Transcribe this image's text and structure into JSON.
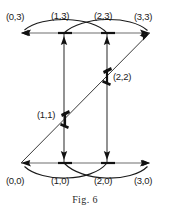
{
  "figure": {
    "caption": "Fig. 6",
    "nodes": [
      {
        "id": "n03",
        "label": "(0,3)",
        "x": 21,
        "y": 33,
        "label_x": 6,
        "label_y": 12
      },
      {
        "id": "n13",
        "label": "(1,3)",
        "x": 64,
        "y": 33,
        "label_x": 51,
        "label_y": 11
      },
      {
        "id": "n23",
        "label": "(2,3)",
        "x": 107,
        "y": 33,
        "label_x": 94,
        "label_y": 11
      },
      {
        "id": "n33",
        "label": "(3,3)",
        "x": 150,
        "y": 33,
        "label_x": 134,
        "label_y": 12
      },
      {
        "id": "n22",
        "label": "(2,2)",
        "x": 107,
        "y": 76,
        "label_x": 113,
        "label_y": 76
      },
      {
        "id": "n11",
        "label": "(1,1)",
        "x": 65,
        "y": 119,
        "label_x": 37,
        "label_y": 114
      },
      {
        "id": "n00",
        "label": "(0,0)",
        "x": 21,
        "y": 163,
        "label_x": 6,
        "label_y": 176
      },
      {
        "id": "n10",
        "label": "(1,0)",
        "x": 64,
        "y": 163,
        "label_x": 51,
        "label_y": 176
      },
      {
        "id": "n20",
        "label": "(2,0)",
        "x": 107,
        "y": 163,
        "label_x": 94,
        "label_y": 176
      },
      {
        "id": "n30",
        "label": "(3,0)",
        "x": 150,
        "y": 163,
        "label_x": 134,
        "label_y": 176
      }
    ],
    "edges": [
      {
        "id": "e-top-row",
        "kind": "straight",
        "from": "n33",
        "to": "n03"
      },
      {
        "id": "e-bottom-row",
        "kind": "straight",
        "from": "n00",
        "to": "n30"
      },
      {
        "id": "e-arc-23-to-03",
        "kind": "arc-up",
        "from": "n23",
        "to": "n03"
      },
      {
        "id": "e-arc-13-to-33",
        "kind": "arc-up",
        "from": "n13",
        "to": "n33"
      },
      {
        "id": "e-arc-20-to-00",
        "kind": "arc-down",
        "from": "n20",
        "to": "n00"
      },
      {
        "id": "e-arc-10-to-30",
        "kind": "arc-down",
        "from": "n10",
        "to": "n30"
      },
      {
        "id": "e-vert-left-up",
        "kind": "vertical",
        "from": "n10",
        "to": "n13"
      },
      {
        "id": "e-vert-left-down",
        "kind": "vertical",
        "from": "n13",
        "to": "n10"
      },
      {
        "id": "e-vert-right-up",
        "kind": "vertical",
        "from": "n20",
        "to": "n23"
      },
      {
        "id": "e-vert-right-down",
        "kind": "vertical",
        "from": "n23",
        "to": "n20"
      },
      {
        "id": "e-diag-00-to-33",
        "kind": "diagonal",
        "from": "n00",
        "to": "n33"
      }
    ],
    "colors": {
      "background": "#ffffff",
      "row_edge": "#6f6f6f",
      "curve_edge": "#1a1a1a",
      "diagonal_edge": "#3a3a3a",
      "vertex_marker": "#111111",
      "label_text": "#1a1a1a",
      "caption_text": "#2a2a2a"
    }
  }
}
